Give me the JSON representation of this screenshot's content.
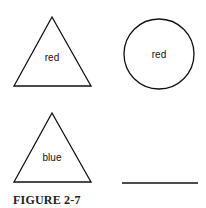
{
  "figure": {
    "caption": "FIGURE 2-7",
    "shapes": [
      {
        "type": "triangle",
        "label": "red"
      },
      {
        "type": "circle",
        "label": "red"
      },
      {
        "type": "triangle",
        "label": "blue"
      },
      {
        "type": "blank-line",
        "label": ""
      }
    ]
  }
}
